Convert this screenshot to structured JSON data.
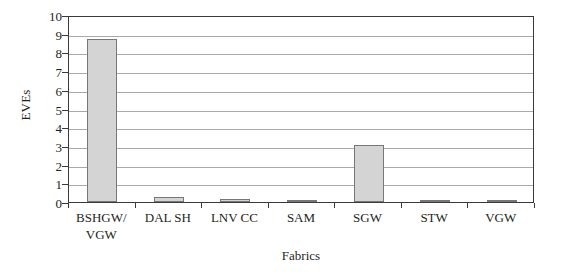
{
  "chart_data": {
    "type": "bar",
    "title": "",
    "xlabel": "Fabrics",
    "ylabel": "EVEs",
    "categories": [
      "BSHGW/ VGW",
      "DAL SH",
      "LNV CC",
      "SAM",
      "SGW",
      "STW",
      "VGW"
    ],
    "category_lines": [
      [
        "BSHGW/",
        "VGW"
      ],
      [
        "DAL SH"
      ],
      [
        "LNV CC"
      ],
      [
        "SAM"
      ],
      [
        "SGW"
      ],
      [
        "STW"
      ],
      [
        "VGW"
      ]
    ],
    "values": [
      8.7,
      0.28,
      0.16,
      0.06,
      3.05,
      0.06,
      0.05
    ],
    "ylim": [
      0,
      10
    ],
    "ytick_labels": [
      "0",
      "1",
      "2",
      "3",
      "4",
      "5",
      "6",
      "7",
      "8",
      "9",
      "10"
    ],
    "ytick_values": [
      0,
      1,
      2,
      3,
      4,
      5,
      6,
      7,
      8,
      9,
      10
    ],
    "grid": true,
    "grid_axis": "y",
    "legend": false,
    "bar_fill_color": "#d4d4d4",
    "bar_border_color": "#777777",
    "gridline_color": "#a9a9a9",
    "axis_color": "#3a3a3a",
    "background_color": "#ffffff",
    "text_color": "#231f20"
  }
}
